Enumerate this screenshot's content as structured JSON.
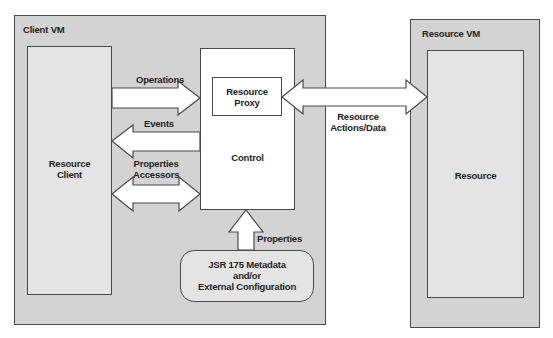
{
  "diagram": {
    "client_vm": {
      "title": "Client VM"
    },
    "resource_vm": {
      "title": "Resource VM"
    },
    "boxes": {
      "resource_client": {
        "line1": "Resource",
        "line2": "Client"
      },
      "control": {
        "label": "Control"
      },
      "resource_proxy": {
        "line1": "Resource",
        "line2": "Proxy"
      },
      "resource": {
        "label": "Resource"
      },
      "metadata": {
        "line1": "JSR 175 Metadata",
        "line2": "and/or",
        "line3": "External Configuration"
      }
    },
    "arrows": {
      "operations": {
        "label": "Operations",
        "direction": "client-to-control"
      },
      "events": {
        "label": "Events",
        "direction": "control-to-client"
      },
      "properties_accessors": {
        "line1": "Properties",
        "line2": "Accessors",
        "direction": "bidirectional"
      },
      "properties": {
        "label": "Properties",
        "direction": "metadata-to-control"
      },
      "resource_actions": {
        "line1": "Resource",
        "line2": "Actions/Data",
        "direction": "bidirectional"
      }
    },
    "colors": {
      "vm_fill": "#d3d3d3",
      "inner_fill": "#e4e4e4",
      "white_fill": "#ffffff",
      "stroke": "#4a4a4a",
      "text": "#1e1e1e"
    }
  }
}
